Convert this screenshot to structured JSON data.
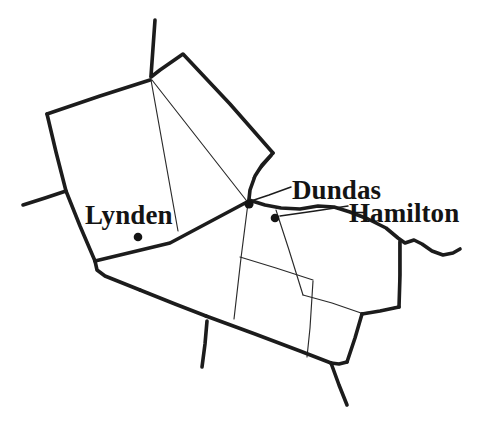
{
  "figure": {
    "kind": "line-drawing-map",
    "width": 482,
    "height": 427,
    "background_color": "#ffffff",
    "ink_color": "#1c1c1c"
  },
  "labels": {
    "lynden": "Lynden",
    "dundas": "Dundas",
    "hamilton": "Hamilton"
  },
  "places": [
    {
      "name": "Lynden",
      "dot": {
        "x": 138,
        "y": 237
      }
    },
    {
      "name": "Dundas",
      "dot": {
        "x": 249,
        "y": 204
      }
    },
    {
      "name": "Hamilton",
      "dot": {
        "x": 275,
        "y": 218
      }
    }
  ],
  "leaders": [
    {
      "for": "Dundas",
      "path": "M 252 202 L 268 196 L 290 188"
    },
    {
      "for": "Hamilton",
      "path": "M 280 217 L 318 211 L 348 207"
    }
  ],
  "geometry": {
    "outer_boundary": "M 47 115 L 147 83 L 151 79 L 155 20 M 151 79 L 157 72 L 182 54 L 272 155 L 258 169 L 252 187 L 249 199 L 253 203 L 277 206 L 300 209 L 325 207 L 348 211 L 372 220 L 392 232 L 402 240 L 414 237 L 424 243 L 437 250 L 446 253 L 458 251 M 47 115 L 65 191 L 95 262 L 97 272 L 140 289 L 205 316 L 207 323 L 202 366 M 207 323 L 236 335 L 300 359 L 330 370 L 346 404",
    "thin_parcels": [
      "M 151 79 L 176 228",
      "M 151 79 L 247 201",
      "M 249 199 L 234 318",
      "M 272 155 L 255 176",
      "M 239 255 L 312 280",
      "M 275 211 L 302 294",
      "M 302 294 L 360 312",
      "M 311 218 L 316 281"
    ],
    "minor_roads": [
      "M 65 191 L 23 204",
      "M 207 323 L 202 366"
    ],
    "right_block": "M 402 240 L 398 308 L 330 288 M 398 308 L 360 312",
    "bottom_block": "M 234 318 L 239 255 L 312 280 L 302 294 L 300 359"
  },
  "rendering": {
    "major_stroke_width": 3.6,
    "minor_stroke_width": 1.15,
    "leader_stroke_width": 1.5,
    "dot_radius": 4.2,
    "label_font_size_px": 27
  }
}
